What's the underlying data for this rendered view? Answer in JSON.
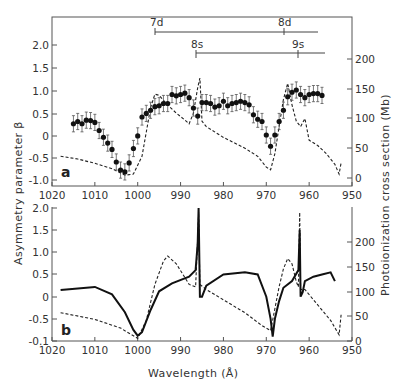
{
  "chart_data": [
    {
      "panel": "a",
      "type": "scatter",
      "title": "",
      "xlabel": "Wavelength (Å)",
      "ylabel_left": "Asymmetry parameter β",
      "ylabel_right": "Photoionization cross section (Mb)",
      "xlim": [
        1020,
        950
      ],
      "ylim_left": [
        -1.0,
        2.5
      ],
      "ylim_right": [
        0,
        250
      ],
      "x_ticks": [
        1020,
        1010,
        1000,
        990,
        980,
        970,
        960,
        950
      ],
      "y_ticks_left": [
        "2.0",
        "1.5",
        "1.0",
        "0.5",
        "0",
        "-0.5",
        "-1.0"
      ],
      "y_ticks_right": [
        "200",
        "150",
        "100",
        "50",
        "0"
      ],
      "grid": false,
      "annotations": [
        {
          "label": "7d",
          "series_start": 996,
          "series_end": 958,
          "level": 1
        },
        {
          "label": "8d",
          "series_start": 966,
          "series_end": 958,
          "level": 1
        },
        {
          "label": "8s",
          "series_start": 986,
          "series_end": 956,
          "level": 2
        },
        {
          "label": "9s",
          "series_start": 962,
          "series_end": 956,
          "level": 2
        }
      ],
      "series": [
        {
          "name": "Measured β (points with error bars)",
          "style": "points",
          "x": [
            1015,
            1014,
            1013,
            1012,
            1011,
            1010,
            1009,
            1008,
            1007,
            1006,
            1005,
            1004,
            1003,
            1002,
            1001,
            1000,
            999,
            998,
            997,
            996,
            995,
            994,
            993,
            992,
            991,
            990,
            989,
            988,
            987,
            986,
            985,
            984,
            983,
            982,
            981,
            980,
            979,
            978,
            977,
            976,
            975,
            974,
            973,
            972,
            971,
            970,
            969,
            968,
            967,
            966,
            965,
            964,
            963,
            962,
            961,
            960,
            959,
            958,
            957
          ],
          "y": [
            0.25,
            0.3,
            0.25,
            0.33,
            0.32,
            0.28,
            0.1,
            -0.05,
            -0.18,
            -0.32,
            -0.6,
            -0.78,
            -0.82,
            -0.62,
            -0.3,
            -0.02,
            0.4,
            0.48,
            0.55,
            0.63,
            0.65,
            0.7,
            0.7,
            0.9,
            0.87,
            0.9,
            0.93,
            0.83,
            0.6,
            0.42,
            0.72,
            0.72,
            0.7,
            0.62,
            0.65,
            0.75,
            0.65,
            0.7,
            0.72,
            0.75,
            0.72,
            0.67,
            0.45,
            0.35,
            0.3,
            0.0,
            -0.25,
            0.0,
            0.3,
            0.55,
            0.85,
            0.95,
            1.0,
            0.9,
            0.83,
            0.9,
            0.92,
            0.92,
            0.88
          ],
          "y_err": 0.18
        },
        {
          "name": "Calculated cross section (dashed, right axis, Mb)",
          "style": "dashed",
          "x": [
            1018,
            1014,
            1010,
            1006,
            1003,
            1001,
            999,
            998,
            997,
            996,
            995,
            993,
            991,
            989,
            988,
            987,
            986,
            985.5,
            985,
            984,
            980,
            975,
            972,
            970,
            969,
            968,
            967,
            966,
            965,
            964,
            963,
            962,
            961,
            960,
            958,
            956,
            954,
            953,
            952.5
          ],
          "y": [
            55,
            50,
            42,
            32,
            20,
            22,
            55,
            100,
            145,
            170,
            168,
            150,
            135,
            122,
            115,
            135,
            182,
            200,
            120,
            110,
            90,
            70,
            55,
            35,
            30,
            60,
            110,
            160,
            190,
            150,
            120,
            110,
            125,
            85,
            75,
            60,
            40,
            22,
            45
          ]
        }
      ]
    },
    {
      "panel": "b",
      "type": "line",
      "title": "",
      "xlabel": "Wavelength (Å)",
      "ylabel_left": "Asymmetry parameter β",
      "ylabel_right": "Photoionization cross section (Mb)",
      "xlim": [
        1020,
        950
      ],
      "ylim_left": [
        -1.0,
        2.0
      ],
      "ylim_right": [
        0,
        250
      ],
      "x_ticks": [
        1020,
        1010,
        1000,
        990,
        980,
        970,
        960,
        950
      ],
      "y_ticks_left": [
        "2.0",
        "1.5",
        "1.0",
        "0.5",
        "0",
        "-0.5",
        "-0.1"
      ],
      "y_ticks_right": [
        "200",
        "150",
        "100",
        "50",
        "0"
      ],
      "grid": false,
      "series": [
        {
          "name": "Calculated β (solid, left axis)",
          "style": "solid",
          "x": [
            1018,
            1010,
            1006,
            1003,
            1001,
            1000,
            999,
            997,
            995,
            992,
            988,
            986.5,
            986,
            985.8,
            985.5,
            985,
            984,
            980,
            975,
            972,
            970,
            969,
            968.5,
            968,
            967,
            966,
            964,
            962.5,
            962.2,
            962,
            961.5,
            961,
            959,
            957,
            955,
            954
          ],
          "y": [
            0.15,
            0.22,
            0.05,
            -0.35,
            -0.75,
            -0.88,
            -0.8,
            -0.3,
            0.12,
            0.3,
            0.45,
            0.6,
            1.2,
            2.0,
            0.0,
            0.0,
            0.25,
            0.5,
            0.55,
            0.5,
            0.0,
            -0.5,
            -0.9,
            -0.5,
            -0.1,
            0.2,
            0.35,
            0.6,
            1.5,
            0.0,
            0.1,
            0.35,
            0.45,
            0.5,
            0.55,
            0.35
          ]
        },
        {
          "name": "Calculated cross section (dashed, right axis, Mb)",
          "style": "dashed",
          "x": [
            1018,
            1010,
            1004,
            1000,
            998,
            996,
            994,
            993,
            991,
            988,
            986.5,
            986,
            985.8,
            985.5,
            984,
            980,
            975,
            971,
            969,
            967,
            966,
            965,
            964,
            963,
            962.5,
            962.2,
            962,
            961,
            958,
            955,
            953,
            952.5
          ],
          "y": [
            55,
            42,
            25,
            5,
            40,
            110,
            155,
            165,
            150,
            110,
            105,
            200,
            250,
            110,
            100,
            80,
            55,
            30,
            20,
            105,
            140,
            160,
            150,
            115,
            105,
            250,
            100,
            100,
            70,
            40,
            12,
            55
          ]
        }
      ]
    }
  ],
  "labels": {
    "panel_a": "a",
    "panel_b": "b",
    "xlabel": "Wavelength (Å)",
    "ylabel_left": "Asymmetry parameter β",
    "ylabel_right": "Photoionization cross section (Mb)",
    "series_7d": "7d",
    "series_8d": "8d",
    "series_8s": "8s",
    "series_9s": "9s",
    "x_ticks": [
      "1020",
      "1010",
      "1000",
      "990",
      "980",
      "970",
      "960",
      "950"
    ],
    "a_left_ticks": [
      "2.0",
      "1.5",
      "1.0",
      "0.5",
      "0",
      "-0.5",
      "-1.0"
    ],
    "a_right_ticks": [
      "200",
      "150",
      "100",
      "50",
      "0"
    ],
    "b_left_ticks": [
      "2.0",
      "1.5",
      "1.0",
      "0.5",
      "0",
      "-0.5",
      "-0.1"
    ],
    "b_right_ticks": [
      "200",
      "150",
      "100",
      "50",
      "0"
    ]
  }
}
